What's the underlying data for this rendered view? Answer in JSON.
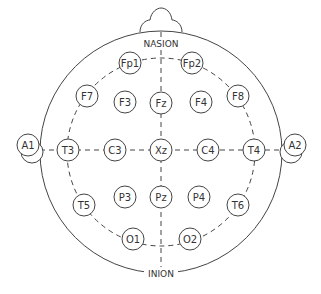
{
  "diagram": {
    "labels": {
      "top": "NASION",
      "bottom": "INION"
    },
    "colors": {
      "stroke": "#444444",
      "background": "#ffffff",
      "text": "#333333"
    },
    "electrodes": [
      {
        "id": "Fp1",
        "x": 130,
        "y": 63
      },
      {
        "id": "Fp2",
        "x": 192,
        "y": 63
      },
      {
        "id": "F7",
        "x": 87,
        "y": 96
      },
      {
        "id": "F3",
        "x": 125,
        "y": 102
      },
      {
        "id": "Fz",
        "x": 161,
        "y": 103
      },
      {
        "id": "F4",
        "x": 201,
        "y": 102
      },
      {
        "id": "F8",
        "x": 238,
        "y": 96
      },
      {
        "id": "T3",
        "x": 68,
        "y": 150
      },
      {
        "id": "C3",
        "x": 115,
        "y": 150
      },
      {
        "id": "Xz",
        "x": 161,
        "y": 150
      },
      {
        "id": "C4",
        "x": 208,
        "y": 150
      },
      {
        "id": "T4",
        "x": 254,
        "y": 150
      },
      {
        "id": "T5",
        "x": 84,
        "y": 205
      },
      {
        "id": "P3",
        "x": 125,
        "y": 197
      },
      {
        "id": "Pz",
        "x": 161,
        "y": 197
      },
      {
        "id": "P4",
        "x": 199,
        "y": 197
      },
      {
        "id": "T6",
        "x": 238,
        "y": 205
      },
      {
        "id": "O1",
        "x": 133,
        "y": 239
      },
      {
        "id": "O2",
        "x": 190,
        "y": 239
      }
    ],
    "ears": [
      {
        "id": "A1",
        "x": 28,
        "y": 145
      },
      {
        "id": "A2",
        "x": 295,
        "y": 145
      }
    ]
  }
}
